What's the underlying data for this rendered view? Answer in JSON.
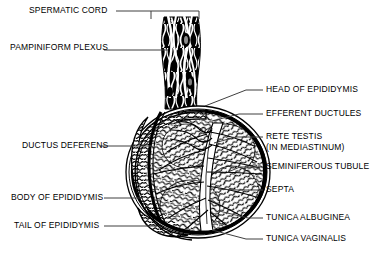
{
  "figure": {
    "style": "black-and-white line engraving",
    "colors": {
      "ink": "#000000",
      "background": "#ffffff",
      "leader": "#4a4a4a"
    }
  },
  "labels_left": [
    {
      "id": "spermatic-cord",
      "text": "SPERMATIC CORD",
      "x": 29,
      "y": 14,
      "leader_to_x": 150,
      "leader_y": 11,
      "bracket": true
    },
    {
      "id": "pampiniform-plexus",
      "text": "PAMPINIFORM PLEXUS",
      "x": 10,
      "y": 51,
      "leader_to_x": 168,
      "leader_y": 50,
      "bracket": false
    },
    {
      "id": "ductus-deferens",
      "text": "DUCTUS DEFERENS",
      "x": 22,
      "y": 149,
      "leader_to_x": 150,
      "leader_y": 143,
      "bracket": false
    },
    {
      "id": "body-of-epididymis",
      "text": "BODY OF EPIDIDYMIS",
      "x": 11,
      "y": 201,
      "leader_to_x": 141,
      "leader_y": 197,
      "bracket": false
    },
    {
      "id": "tail-of-epididymis",
      "text": "TAIL OF EPIDIDYMIS",
      "x": 14,
      "y": 229,
      "leader_to_x": 152,
      "leader_y": 224,
      "bracket": false
    }
  ],
  "labels_right": [
    {
      "id": "head-of-epididymis",
      "text": "HEAD OF EPIDIDYMIS",
      "x": 266,
      "y": 93,
      "leader_to_x": 205,
      "leader_y": 105
    },
    {
      "id": "efferent-ductules",
      "text": "EFFERENT DUCTULES",
      "x": 266,
      "y": 117,
      "leader_to_x": 212,
      "leader_y": 120
    },
    {
      "id": "rete-testis",
      "text": "RETE TESTIS",
      "x": 266,
      "y": 140,
      "leader_to_x": 214,
      "leader_y": 143
    },
    {
      "id": "rete-testis-sub",
      "text": "(IN MEDIASTINUM)",
      "x": 266,
      "y": 151,
      "leader_to_x": null,
      "leader_y": null
    },
    {
      "id": "seminiferous-tubule",
      "text": "SEMINIFEROUS TUBULE",
      "x": 266,
      "y": 170,
      "leader_to_x": 228,
      "leader_y": 172
    },
    {
      "id": "septa",
      "text": "SEPTA",
      "x": 266,
      "y": 193,
      "leader_to_x": 218,
      "leader_y": 190
    },
    {
      "id": "tunica-albuginea",
      "text": "TUNICA ALBUGINEA",
      "x": 266,
      "y": 221,
      "leader_to_x": 219,
      "leader_y": 212
    },
    {
      "id": "tunica-vaginalis",
      "text": "TUNICA VAGINALIS",
      "x": 266,
      "y": 242,
      "leader_to_x": 213,
      "leader_y": 231
    }
  ],
  "anatomy_parts": [
    "spermatic cord",
    "pampiniform plexus",
    "ductus deferens",
    "head of epididymis",
    "body of epididymis",
    "tail of epididymis",
    "efferent ductules",
    "rete testis",
    "seminiferous tubule",
    "septa",
    "tunica albuginea",
    "tunica vaginalis"
  ]
}
